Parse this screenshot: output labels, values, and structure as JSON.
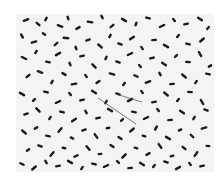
{
  "image": {
    "subject": "micrograph of rod-shaped bacteria",
    "background_color": "#f4f4f4",
    "page_color": "#ffffff",
    "cell_color": "#1a1a1a",
    "cells": [
      [
        10,
        6,
        14,
        -20
      ],
      [
        22,
        10,
        12,
        40
      ],
      [
        30,
        5,
        10,
        -60
      ],
      [
        44,
        12,
        14,
        20
      ],
      [
        52,
        4,
        10,
        70
      ],
      [
        62,
        14,
        12,
        -30
      ],
      [
        74,
        8,
        14,
        10
      ],
      [
        86,
        3,
        10,
        60
      ],
      [
        96,
        12,
        12,
        -40
      ],
      [
        108,
        6,
        14,
        30
      ],
      [
        120,
        10,
        10,
        -70
      ],
      [
        132,
        4,
        12,
        15
      ],
      [
        146,
        12,
        14,
        -25
      ],
      [
        158,
        6,
        10,
        50
      ],
      [
        170,
        10,
        12,
        -10
      ],
      [
        184,
        5,
        14,
        35
      ],
      [
        192,
        14,
        10,
        -50
      ],
      [
        6,
        22,
        12,
        60
      ],
      [
        18,
        28,
        14,
        -15
      ],
      [
        28,
        20,
        10,
        35
      ],
      [
        40,
        30,
        12,
        -45
      ],
      [
        50,
        24,
        14,
        5
      ],
      [
        60,
        34,
        10,
        70
      ],
      [
        72,
        26,
        12,
        -20
      ],
      [
        84,
        32,
        14,
        40
      ],
      [
        94,
        22,
        10,
        -60
      ],
      [
        104,
        30,
        12,
        20
      ],
      [
        116,
        24,
        14,
        -35
      ],
      [
        126,
        34,
        10,
        55
      ],
      [
        138,
        26,
        12,
        -5
      ],
      [
        150,
        32,
        14,
        30
      ],
      [
        162,
        22,
        10,
        -50
      ],
      [
        172,
        30,
        12,
        15
      ],
      [
        186,
        26,
        14,
        -40
      ],
      [
        8,
        44,
        14,
        25
      ],
      [
        20,
        38,
        10,
        -55
      ],
      [
        32,
        48,
        12,
        10
      ],
      [
        42,
        40,
        14,
        -30
      ],
      [
        54,
        50,
        10,
        65
      ],
      [
        66,
        42,
        12,
        -10
      ],
      [
        78,
        52,
        14,
        45
      ],
      [
        90,
        44,
        10,
        -65
      ],
      [
        102,
        48,
        12,
        20
      ],
      [
        114,
        40,
        14,
        -25
      ],
      [
        124,
        52,
        10,
        50
      ],
      [
        136,
        44,
        12,
        -15
      ],
      [
        148,
        50,
        14,
        35
      ],
      [
        160,
        42,
        10,
        -45
      ],
      [
        172,
        48,
        12,
        5
      ],
      [
        184,
        40,
        14,
        60
      ],
      [
        194,
        52,
        10,
        -30
      ],
      [
        12,
        62,
        12,
        -40
      ],
      [
        24,
        58,
        14,
        20
      ],
      [
        36,
        68,
        10,
        -60
      ],
      [
        48,
        60,
        12,
        30
      ],
      [
        58,
        70,
        14,
        -10
      ],
      [
        70,
        62,
        10,
        55
      ],
      [
        82,
        68,
        12,
        -35
      ],
      [
        96,
        60,
        14,
        15
      ],
      [
        108,
        70,
        10,
        -50
      ],
      [
        120,
        62,
        12,
        25
      ],
      [
        132,
        68,
        14,
        -20
      ],
      [
        144,
        60,
        10,
        60
      ],
      [
        156,
        70,
        12,
        -5
      ],
      [
        168,
        62,
        14,
        40
      ],
      [
        180,
        68,
        10,
        -55
      ],
      [
        192,
        60,
        12,
        10
      ],
      [
        6,
        80,
        14,
        30
      ],
      [
        18,
        86,
        10,
        -45
      ],
      [
        30,
        78,
        12,
        15
      ],
      [
        42,
        88,
        14,
        -25
      ],
      [
        54,
        80,
        10,
        50
      ],
      [
        66,
        86,
        12,
        -15
      ],
      [
        78,
        78,
        14,
        35
      ],
      [
        90,
        88,
        10,
        -60
      ],
      [
        102,
        80,
        12,
        20
      ],
      [
        114,
        86,
        14,
        -30
      ],
      [
        126,
        78,
        10,
        55
      ],
      [
        138,
        88,
        12,
        -10
      ],
      [
        150,
        80,
        14,
        40
      ],
      [
        162,
        86,
        10,
        -50
      ],
      [
        174,
        78,
        12,
        5
      ],
      [
        186,
        88,
        14,
        60
      ],
      [
        10,
        100,
        12,
        -20
      ],
      [
        22,
        96,
        14,
        45
      ],
      [
        34,
        104,
        10,
        -55
      ],
      [
        46,
        98,
        12,
        15
      ],
      [
        58,
        106,
        14,
        -35
      ],
      [
        70,
        98,
        10,
        60
      ],
      [
        82,
        104,
        12,
        -15
      ],
      [
        94,
        96,
        14,
        30
      ],
      [
        106,
        106,
        10,
        -45
      ],
      [
        118,
        98,
        12,
        10
      ],
      [
        130,
        104,
        14,
        -25
      ],
      [
        142,
        96,
        10,
        50
      ],
      [
        154,
        106,
        12,
        -5
      ],
      [
        166,
        98,
        14,
        35
      ],
      [
        178,
        104,
        10,
        -60
      ],
      [
        190,
        96,
        12,
        20
      ],
      [
        8,
        118,
        14,
        40
      ],
      [
        20,
        114,
        10,
        -30
      ],
      [
        32,
        122,
        12,
        10
      ],
      [
        44,
        116,
        14,
        -50
      ],
      [
        56,
        124,
        10,
        25
      ],
      [
        68,
        116,
        12,
        -20
      ],
      [
        80,
        122,
        14,
        55
      ],
      [
        92,
        114,
        10,
        -10
      ],
      [
        104,
        124,
        12,
        35
      ],
      [
        116,
        116,
        14,
        -40
      ],
      [
        128,
        122,
        10,
        15
      ],
      [
        140,
        114,
        12,
        -60
      ],
      [
        152,
        124,
        14,
        30
      ],
      [
        164,
        116,
        10,
        -25
      ],
      [
        176,
        122,
        12,
        45
      ],
      [
        188,
        114,
        14,
        -15
      ],
      [
        12,
        136,
        10,
        -35
      ],
      [
        24,
        132,
        12,
        20
      ],
      [
        36,
        140,
        14,
        -50
      ],
      [
        48,
        134,
        10,
        10
      ],
      [
        60,
        142,
        12,
        -25
      ],
      [
        72,
        134,
        14,
        50
      ],
      [
        84,
        140,
        10,
        -5
      ],
      [
        96,
        132,
        12,
        35
      ],
      [
        108,
        142,
        14,
        -45
      ],
      [
        120,
        134,
        10,
        15
      ],
      [
        132,
        140,
        12,
        -30
      ],
      [
        144,
        132,
        14,
        55
      ],
      [
        156,
        142,
        10,
        -15
      ],
      [
        168,
        134,
        12,
        40
      ],
      [
        180,
        140,
        14,
        -55
      ],
      [
        192,
        132,
        10,
        5
      ],
      [
        6,
        150,
        12,
        25
      ],
      [
        18,
        154,
        14,
        -40
      ],
      [
        30,
        148,
        10,
        60
      ],
      [
        42,
        152,
        12,
        -10
      ],
      [
        54,
        148,
        14,
        30
      ],
      [
        66,
        154,
        10,
        -55
      ],
      [
        78,
        150,
        12,
        15
      ],
      [
        90,
        152,
        14,
        -25
      ],
      [
        102,
        148,
        10,
        45
      ],
      [
        114,
        154,
        12,
        -5
      ],
      [
        126,
        150,
        14,
        35
      ],
      [
        138,
        152,
        10,
        -50
      ],
      [
        150,
        148,
        12,
        20
      ],
      [
        162,
        154,
        14,
        -30
      ],
      [
        174,
        150,
        10,
        55
      ],
      [
        186,
        152,
        12,
        -15
      ]
    ],
    "filaments": [
      {
        "x1": 82,
        "y1": 84,
        "x2": 120,
        "y2": 110
      },
      {
        "x1": 100,
        "y1": 80,
        "x2": 126,
        "y2": 88
      }
    ]
  }
}
